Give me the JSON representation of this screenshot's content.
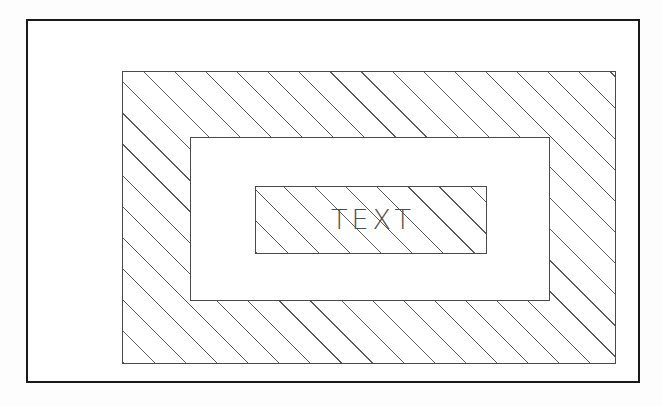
{
  "diagram": {
    "background_color": "#fdfdfd",
    "frame": {
      "name": "outer-frame",
      "border_color": "#1a1a1a",
      "fill": "none"
    },
    "layers": [
      {
        "name": "outer-hatched-region",
        "fill": "diagonal-hatch",
        "hatch_angle_deg": 45,
        "hatch_spacing_px": 22,
        "hatch_color": "#5c5c5c",
        "border_color": "#4a4a4a"
      },
      {
        "name": "middle-plain-region",
        "fill": "white",
        "border_color": "#4a4a4a"
      },
      {
        "name": "inner-hatched-region",
        "fill": "diagonal-hatch",
        "hatch_angle_deg": 45,
        "hatch_spacing_px": 22,
        "hatch_color": "#5c5c5c",
        "border_color": "#4a4a4a"
      }
    ],
    "label": {
      "name": "text-label",
      "value": "TEXT",
      "color": "#4d4d4d"
    }
  }
}
